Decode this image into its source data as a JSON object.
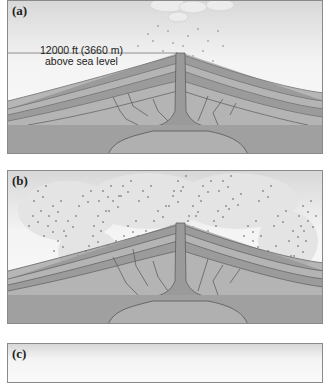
{
  "figure": {
    "panels": [
      {
        "id": "a",
        "label": "(a)",
        "annotation_line1": "12000 ft (3660 m)",
        "annotation_line2": "above sea level",
        "state": "small eruption plume above intact volcanic cone"
      },
      {
        "id": "b",
        "label": "(b)",
        "state": "large ash cloud spreading over volcanic cone"
      },
      {
        "id": "c",
        "label": "(c)",
        "state": "panel cropped at bottom edge"
      }
    ],
    "colors": {
      "layer_dark": "#8c8c8c",
      "layer_light": "#b4b4b4",
      "base": "#9a9a9a",
      "conduit": "#a0a0a0",
      "outline": "#555555",
      "border": "#8a8a8a"
    }
  }
}
